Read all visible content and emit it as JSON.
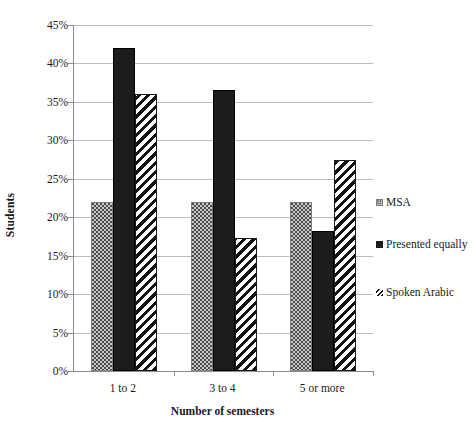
{
  "chart_data": {
    "type": "bar",
    "title": "",
    "xlabel": "Number of semesters",
    "ylabel": "Students",
    "categories": [
      "1 to 2",
      "3 to 4",
      "5 or more"
    ],
    "series": [
      {
        "name": "MSA",
        "values": [
          22,
          22,
          22
        ],
        "pattern": "dotted-light-gray"
      },
      {
        "name": "Presented equally",
        "values": [
          42,
          36.5,
          18.2
        ],
        "pattern": "solid-black"
      },
      {
        "name": "Spoken Arabic",
        "values": [
          36,
          17.3,
          27.4
        ],
        "pattern": "diagonal-hatch"
      }
    ],
    "ylim": [
      0,
      45
    ],
    "ytick_labels": [
      "45%",
      "40%",
      "35%",
      "30%",
      "25%",
      "20%",
      "15%",
      "10%",
      "5%",
      "0%"
    ],
    "ytick_values": [
      45,
      40,
      35,
      30,
      25,
      20,
      15,
      10,
      5,
      0
    ],
    "grid": true,
    "legend_position": "right",
    "legend": [
      "MSA",
      "Presented equally",
      "Spoken Arabic"
    ]
  },
  "axis": {
    "y_title": "Students",
    "x_title": "Number of semesters"
  }
}
